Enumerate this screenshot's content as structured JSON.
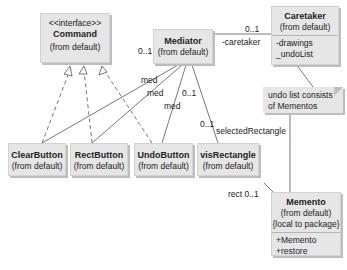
{
  "diagram": {
    "type": "UML class diagram (Memento pattern)",
    "classes": {
      "command": {
        "stereotype": "<<interface>>",
        "name": "Command",
        "package": "(from default)"
      },
      "mediator": {
        "name": "Mediator",
        "package": "(from default)"
      },
      "caretaker": {
        "name": "Caretaker",
        "package": "(from default)",
        "attributes": [
          "-drawings",
          "_undoList"
        ]
      },
      "clear_button": {
        "name": "ClearButton",
        "package": "(from default)"
      },
      "rect_button": {
        "name": "RectButton",
        "package": "(from default)"
      },
      "undo_button": {
        "name": "UndoButton",
        "package": "(from default)"
      },
      "vis_rectangle": {
        "name": "visRectangle",
        "package": "(from default)"
      },
      "memento": {
        "name": "Memento",
        "package": "(from default)",
        "visibility": "{local to package}",
        "operations": [
          "+Memento",
          "+restore"
        ]
      }
    },
    "note": {
      "line1": "undo list consists",
      "line2": "of Mementos"
    },
    "labels": {
      "mediator_mult": "0..1",
      "caretaker_mult": "0..1",
      "caretaker_role": "-caretaker",
      "med1": "med",
      "med2": "med",
      "med3": "med",
      "med_mult": "0..1",
      "selrect_mult": "0..1",
      "selrect_role": "selectedRectangle",
      "rect_role": "rect 0..1"
    }
  }
}
